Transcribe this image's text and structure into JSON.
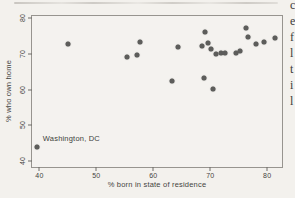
{
  "page": {
    "background_color": "#f3f1ed",
    "text_color": "#45443f",
    "marker_color": "#5d5d5b"
  },
  "artifacts": {
    "right_edge_letter_fragments": [
      "c",
      "e",
      "f",
      "l",
      "t",
      "i",
      "l"
    ]
  },
  "chart_data": {
    "type": "scatter",
    "xlabel": "% born in state of residence",
    "ylabel": "% who own home",
    "x_ticks": [
      40,
      50,
      60,
      70,
      80
    ],
    "y_ticks": [
      40,
      50,
      60,
      70,
      80
    ],
    "xlim": [
      38.7,
      82.6
    ],
    "ylim": [
      38.3,
      80.6
    ],
    "grid": false,
    "legend": null,
    "marker_color": "#5d5d5b",
    "x": [
      39.5,
      45.0,
      55.3,
      57.2,
      57.7,
      63.2,
      64.4,
      68.5,
      68.9,
      69.0,
      69.6,
      70.2,
      70.5,
      71.0,
      71.9,
      72.6,
      74.5,
      75.3,
      76.2,
      76.6,
      78.0,
      79.5,
      81.3
    ],
    "y": [
      44.0,
      72.7,
      69.1,
      69.8,
      73.3,
      62.4,
      71.9,
      72.3,
      63.1,
      76.2,
      73.1,
      71.3,
      60.2,
      69.9,
      70.2,
      70.3,
      70.3,
      70.9,
      77.3,
      74.7,
      72.8,
      73.4,
      74.4
    ],
    "annotations": [
      {
        "text": "Washington, DC",
        "point_x": 39.5,
        "point_y": 44.0,
        "label_x": 40.6,
        "label_y": 46.4
      }
    ]
  }
}
